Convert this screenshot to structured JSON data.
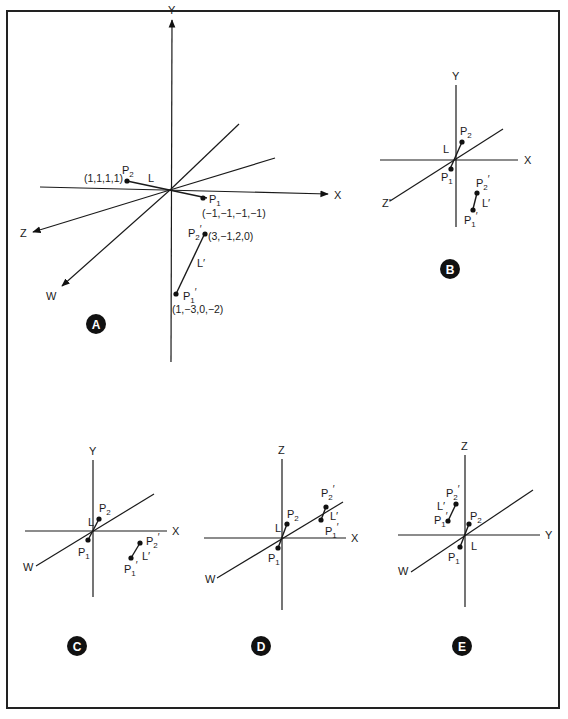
{
  "figure": {
    "frame_color": "#222222"
  },
  "panels": [
    {
      "id": "A",
      "badge": "A",
      "badge_pos": [
        96,
        324
      ],
      "origin": [
        170,
        190
      ],
      "axes": [
        {
          "name": "Y",
          "label": "Y",
          "to": [
            172,
            20
          ],
          "from": [
            171,
            362
          ],
          "arrow": true,
          "label_pos": [
            168,
            14
          ]
        },
        {
          "name": "X",
          "label": "X",
          "to": [
            328,
            194
          ],
          "from": [
            40,
            187
          ],
          "arrow": true,
          "label_pos": [
            334,
            199
          ]
        },
        {
          "name": "Z",
          "label": "Z",
          "to": [
            33,
            232
          ],
          "arrow": true,
          "label_pos": [
            20,
            237
          ]
        },
        {
          "name": "W",
          "label": "W",
          "to": [
            62,
            286
          ],
          "arrow": true,
          "label_pos": [
            46,
            300
          ]
        },
        {
          "name": "Z-neg",
          "label": "",
          "to": [
            239,
            124
          ],
          "arrow": false
        },
        {
          "name": "W-neg",
          "label": "",
          "to": [
            275,
            158
          ],
          "arrow": false
        }
      ],
      "segments": [
        {
          "name": "L",
          "label": "L",
          "from": [
            127,
            181
          ],
          "to": [
            207,
            198
          ],
          "label_pos": [
            148,
            182
          ]
        },
        {
          "name": "L-prime",
          "label": "L′",
          "from": [
            176,
            294
          ],
          "to": [
            205,
            233
          ],
          "label_pos": [
            197,
            267
          ]
        }
      ],
      "points": [
        {
          "name": "P2",
          "label": "P",
          "sub": "2",
          "prime": "",
          "at": [
            127,
            181
          ],
          "label_pos": [
            122,
            174
          ],
          "coord": "(1,1,1,1)",
          "coord_pos": [
            84,
            182
          ]
        },
        {
          "name": "P1",
          "label": "P",
          "sub": "1",
          "prime": "",
          "at": [
            203,
            198
          ],
          "label_pos": [
            209,
            203
          ],
          "coord": "(−1,−1,−1,−1)",
          "coord_pos": [
            202,
            217
          ]
        },
        {
          "name": "P2-prime",
          "label": "P",
          "sub": "2",
          "prime": "′",
          "at": [
            205,
            234
          ],
          "label_pos": [
            188,
            237
          ],
          "coord": "(3,−1,2,0)",
          "coord_pos": [
            208,
            240
          ]
        },
        {
          "name": "P1-prime",
          "label": "P",
          "sub": "1",
          "prime": "′",
          "at": [
            176,
            294
          ],
          "label_pos": [
            183,
            300
          ],
          "coord": "(1,−3,0,−2)",
          "coord_pos": [
            172,
            313
          ]
        }
      ]
    },
    {
      "id": "B",
      "badge": "B",
      "badge_pos": [
        450,
        269
      ],
      "origin": [
        456,
        160
      ],
      "axes": [
        {
          "name": "Y",
          "label": "Y",
          "from": [
            456,
            227
          ],
          "to": [
            456,
            85
          ],
          "label_pos": [
            452,
            80
          ]
        },
        {
          "name": "X",
          "label": "X",
          "from": [
            380,
            160
          ],
          "to": [
            518,
            160
          ],
          "label_pos": [
            524,
            164
          ]
        },
        {
          "name": "Z",
          "label": "Z′",
          "from": [
            390,
            201
          ],
          "to": [
            503,
            129
          ],
          "label_pos": [
            382,
            207
          ]
        }
      ],
      "segments": [
        {
          "name": "L",
          "label": "L",
          "from": [
            450,
            169
          ],
          "to": [
            462,
            142
          ],
          "label_pos": [
            443,
            153
          ]
        },
        {
          "name": "L-prime",
          "label": "L′",
          "from": [
            473,
            209
          ],
          "to": [
            477,
            193
          ],
          "label_pos": [
            482,
            207
          ]
        }
      ],
      "points": [
        {
          "name": "P2",
          "label": "P",
          "sub": "2",
          "prime": "",
          "at": [
            462,
            142
          ],
          "label_pos": [
            460,
            135
          ]
        },
        {
          "name": "P1",
          "label": "P",
          "sub": "1",
          "prime": "",
          "at": [
            451,
            169
          ],
          "label_pos": [
            441,
            181
          ]
        },
        {
          "name": "P2-prime",
          "label": "P",
          "sub": "2",
          "prime": "′",
          "at": [
            477,
            193
          ],
          "label_pos": [
            476,
            187
          ]
        },
        {
          "name": "P1-prime",
          "label": "P",
          "sub": "1",
          "prime": "′",
          "at": [
            473,
            210
          ],
          "label_pos": [
            464,
            224
          ]
        }
      ]
    },
    {
      "id": "C",
      "badge": "C",
      "badge_pos": [
        77,
        646
      ],
      "origin": [
        93,
        531
      ],
      "axes": [
        {
          "name": "Y",
          "label": "Y",
          "from": [
            93,
            597
          ],
          "to": [
            93,
            460
          ],
          "label_pos": [
            89,
            455
          ]
        },
        {
          "name": "X",
          "label": "X",
          "from": [
            25,
            531
          ],
          "to": [
            167,
            531
          ],
          "label_pos": [
            172,
            535
          ]
        },
        {
          "name": "W",
          "label": "W",
          "from": [
            36,
            566
          ],
          "to": [
            154,
            494
          ],
          "label_pos": [
            23,
            571
          ]
        }
      ],
      "segments": [
        {
          "name": "L",
          "label": "L",
          "from": [
            88,
            540
          ],
          "to": [
            99,
            519
          ],
          "label_pos": [
            88,
            526
          ]
        },
        {
          "name": "L-prime",
          "label": "L′",
          "from": [
            131,
            558
          ],
          "to": [
            140,
            543
          ],
          "label_pos": [
            142,
            560
          ]
        }
      ],
      "points": [
        {
          "name": "P2",
          "label": "P",
          "sub": "2",
          "prime": "",
          "at": [
            99,
            519
          ],
          "label_pos": [
            99,
            512
          ]
        },
        {
          "name": "P1",
          "label": "P",
          "sub": "1",
          "prime": "",
          "at": [
            88,
            540
          ],
          "label_pos": [
            78,
            556
          ]
        },
        {
          "name": "P2-prime",
          "label": "P",
          "sub": "2",
          "prime": "′",
          "at": [
            140,
            543
          ],
          "label_pos": [
            146,
            545
          ]
        },
        {
          "name": "P1-prime",
          "label": "P",
          "sub": "1",
          "prime": "′",
          "at": [
            131,
            558
          ],
          "label_pos": [
            124,
            573
          ]
        }
      ]
    },
    {
      "id": "D",
      "badge": "D",
      "badge_pos": [
        261,
        646
      ],
      "origin": [
        282,
        538
      ],
      "axes": [
        {
          "name": "Z",
          "label": "Z",
          "from": [
            282,
            610
          ],
          "to": [
            282,
            459
          ],
          "label_pos": [
            278,
            454
          ]
        },
        {
          "name": "X",
          "label": "X",
          "from": [
            204,
            538
          ],
          "to": [
            346,
            538
          ],
          "label_pos": [
            351,
            542
          ]
        },
        {
          "name": "W",
          "label": "W",
          "from": [
            217,
            578
          ],
          "to": [
            343,
            502
          ],
          "label_pos": [
            205,
            583
          ]
        }
      ],
      "segments": [
        {
          "name": "L",
          "label": "L",
          "from": [
            278,
            548
          ],
          "to": [
            287,
            524
          ],
          "label_pos": [
            275,
            532
          ]
        },
        {
          "name": "L-prime",
          "label": "L′",
          "from": [
            321,
            520
          ],
          "to": [
            326,
            507
          ],
          "label_pos": [
            330,
            520
          ]
        }
      ],
      "points": [
        {
          "name": "P2",
          "label": "P",
          "sub": "2",
          "prime": "",
          "at": [
            287,
            524
          ],
          "label_pos": [
            287,
            518
          ]
        },
        {
          "name": "P1",
          "label": "P",
          "sub": "1",
          "prime": "",
          "at": [
            278,
            548
          ],
          "label_pos": [
            268,
            562
          ]
        },
        {
          "name": "P2-prime",
          "label": "P",
          "sub": "2",
          "prime": "′",
          "at": [
            326,
            507
          ],
          "label_pos": [
            321,
            497
          ]
        },
        {
          "name": "P1-prime",
          "label": "P",
          "sub": "1",
          "prime": "′",
          "at": [
            321,
            520
          ],
          "label_pos": [
            325,
            535
          ]
        }
      ]
    },
    {
      "id": "E",
      "badge": "E",
      "badge_pos": [
        462,
        646
      ],
      "origin": [
        465,
        535
      ],
      "axes": [
        {
          "name": "Z",
          "label": "Z",
          "from": [
            465,
            607
          ],
          "to": [
            465,
            455
          ],
          "label_pos": [
            461,
            450
          ]
        },
        {
          "name": "Y",
          "label": "Y",
          "from": [
            398,
            535
          ],
          "to": [
            540,
            535
          ],
          "label_pos": [
            545,
            539
          ]
        },
        {
          "name": "W",
          "label": "W",
          "from": [
            411,
            572
          ],
          "to": [
            533,
            490
          ],
          "label_pos": [
            398,
            575
          ]
        }
      ],
      "segments": [
        {
          "name": "L",
          "label": "L",
          "from": [
            460,
            547
          ],
          "to": [
            469,
            524
          ],
          "label_pos": [
            471,
            550
          ]
        },
        {
          "name": "L-prime",
          "label": "L′",
          "from": [
            448,
            521
          ],
          "to": [
            456,
            504
          ],
          "label_pos": [
            437,
            510
          ]
        }
      ],
      "points": [
        {
          "name": "P2",
          "label": "P",
          "sub": "2",
          "prime": "",
          "at": [
            469,
            524
          ],
          "label_pos": [
            470,
            520
          ]
        },
        {
          "name": "P1",
          "label": "P",
          "sub": "1",
          "prime": "",
          "at": [
            460,
            547
          ],
          "label_pos": [
            448,
            561
          ]
        },
        {
          "name": "P2-prime",
          "label": "P",
          "sub": "2",
          "prime": "′",
          "at": [
            456,
            504
          ],
          "label_pos": [
            446,
            497
          ]
        },
        {
          "name": "P1-prime",
          "label": "P",
          "sub": "1",
          "prime": "′",
          "at": [
            448,
            521
          ],
          "label_pos": [
            434,
            524
          ]
        }
      ]
    }
  ]
}
